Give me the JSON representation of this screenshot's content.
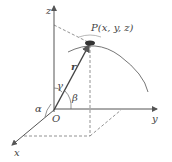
{
  "diagram": {
    "type": "3d-coordinate-direction-angles",
    "point_label": "P(x, y, z)",
    "vector_label": "r",
    "origin_label": "O",
    "axes": {
      "x": "x",
      "y": "y",
      "z": "z"
    },
    "angles": {
      "alpha": "α",
      "beta": "β",
      "gamma": "γ"
    },
    "colors": {
      "line": "#555555",
      "dashed": "#777777",
      "text": "#444444"
    }
  }
}
